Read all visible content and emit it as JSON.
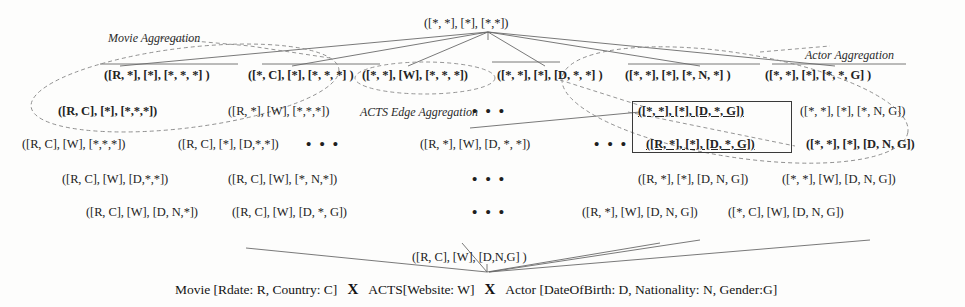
{
  "figure": {
    "type": "lattice-diagram",
    "labels": {
      "movie_aggregation": "Movie Aggregation",
      "acts_edge_aggregation": "ACTS Edge Aggregation",
      "actor_aggregation": "Actor Aggregation"
    },
    "caption": {
      "part1": "Movie [Rdate: R, Country: C]",
      "op1": "X",
      "part2": "ACTS[Website: W]",
      "op2": "X",
      "part3": "Actor [DateOfBirth: D, Nationality: N, Gender:G]"
    },
    "ellipsis": "• • •",
    "nodes": {
      "apex": "([*, *], [*], [*,*])",
      "bottom": "([R, C], [W], [D,N,G] )",
      "level1": [
        "([R, *], [*], [*, *, *] )",
        "([*, C], [*], [*, *, *] )",
        "([*, *], [W], [*, *, *])",
        "([*, *], [*], [D, *, *] )",
        "([*, *], [*], [*, N, *] )",
        "([*, *], [*], [*, *, G] )"
      ],
      "level2": [
        "([R, C], [*], [*,*,*])",
        "([R, *], [W], [*,*,*])",
        "([*, *], [*], [D, *, G])",
        "([*, *], [*], [*, N, G])"
      ],
      "level3": [
        "([R, C], [W], [*,*,*])",
        "([R, C], [*], [D,*,*])",
        "([R, *], [W], [D, *, *])",
        "([R, *], [*], [D, *, G])",
        "([*, *], [*], [D, N, G])"
      ],
      "level4": [
        "([R, C], [W], [D,*,*])",
        "([R, C], [W], [*, N,*])",
        "([R, *], [*], [D, N, G])",
        "([*, *], [W], [D, N, G])"
      ],
      "level5": [
        "([R, C], [W], [D, N,*])",
        "([R, C], [W], [D, *, G])",
        "([R, *], [W], [D, N, G])",
        "([*, C], [W], [D, N, G])"
      ]
    },
    "colors": {
      "background": "#fdfdfc",
      "text": "#232323",
      "line": "#6a6a6a",
      "dashed_ellipse": "#8a8a8a",
      "selection_box": "#3a3a3a"
    }
  }
}
